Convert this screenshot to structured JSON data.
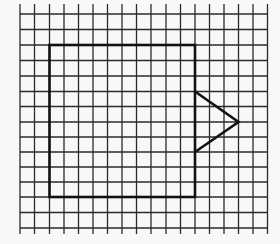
{
  "diagram": {
    "title": "Square with triangle on grid",
    "background": "#f8f8f8",
    "grid": {
      "color": "#2a2a2a",
      "line_width": 1.3,
      "x_lines": [
        20,
        34.5,
        49.5,
        64,
        78.5,
        93,
        107.5,
        122,
        136.5,
        151,
        166,
        180.5,
        195,
        209.5,
        224,
        238.5,
        253,
        267.5
      ],
      "y_lines": [
        14,
        29.5,
        45,
        60.5,
        76,
        91.5,
        106.5,
        122,
        137,
        152,
        167,
        182,
        197,
        212.5,
        228
      ],
      "extend_top": 24,
      "extend_bottom": 234,
      "extend_left": 20,
      "extend_right": 267.5
    },
    "shapes": [
      {
        "name": "square",
        "type": "rect",
        "x": 49.5,
        "y": 45,
        "width": 145.5,
        "height": 152,
        "stroke": "#111111",
        "stroke_width": 2.6
      },
      {
        "name": "triangle",
        "type": "polyline",
        "points": "195,91.5 238.5,122 195,152",
        "stroke": "#111111",
        "stroke_width": 2.6
      }
    ]
  }
}
